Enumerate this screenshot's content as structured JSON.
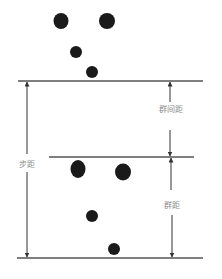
{
  "diagram": {
    "labels": {
      "inter_group_distance": "群间距",
      "step_distance": "步距",
      "group_distance": "群距"
    },
    "colors": {
      "dot": "#1a1a1a",
      "line": "#555555",
      "label": "#8a8a8a"
    },
    "groups": [
      {
        "name": "upper-group",
        "dots": [
          {
            "cx": 61,
            "cy": 21,
            "r": 8
          },
          {
            "cx": 107,
            "cy": 21,
            "r": 8
          },
          {
            "cx": 76,
            "cy": 52,
            "r": 6
          },
          {
            "cx": 92,
            "cy": 72,
            "r": 6
          }
        ]
      },
      {
        "name": "lower-group",
        "dots": [
          {
            "cx": 78,
            "cy": 169,
            "r": 8
          },
          {
            "cx": 123,
            "cy": 172,
            "r": 8
          },
          {
            "cx": 92,
            "cy": 216,
            "r": 6
          },
          {
            "cx": 114,
            "cy": 249,
            "r": 6
          }
        ]
      }
    ]
  }
}
